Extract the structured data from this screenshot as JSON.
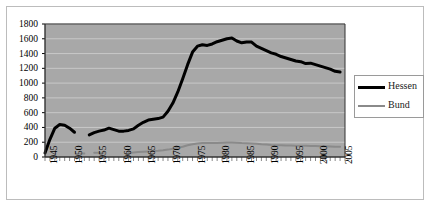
{
  "chart_data": {
    "type": "line",
    "title": "",
    "subtitle": "",
    "xlabel": "",
    "ylabel": "",
    "xlim": [
      1945,
      2006
    ],
    "ylim": [
      0,
      1800
    ],
    "ytick_step": 200,
    "yticks": [
      "0",
      "200",
      "400",
      "600",
      "800",
      "1000",
      "1200",
      "1400",
      "1600",
      "1800"
    ],
    "xticks": [
      "1945",
      "1950",
      "1955",
      "1960",
      "1965",
      "1970",
      "1975",
      "1980",
      "1985",
      "1990",
      "1995",
      "2000",
      "2005"
    ],
    "xtick_step": 5,
    "minor_xticks_every_year": true,
    "grid": "horizontal",
    "grid_color": "#c8c8c8",
    "plot_background": "#a8a8a8",
    "legend_position": "right",
    "legend": [
      "Hessen",
      "Bund"
    ],
    "series": [
      {
        "name": "Hessen",
        "color": "#000000",
        "width": 3,
        "segments": [
          {
            "x": [
              1945,
              1946,
              1947,
              1948,
              1949,
              1950,
              1951
            ],
            "y": [
              55,
              240,
              390,
              440,
              430,
              390,
              335
            ]
          },
          {
            "x": [
              1954,
              1955,
              1956,
              1957,
              1958,
              1959,
              1960,
              1961,
              1962,
              1963,
              1964,
              1965,
              1966,
              1967,
              1968,
              1969,
              1970,
              1971,
              1972,
              1973,
              1974,
              1975,
              1976,
              1977,
              1978,
              1979,
              1980,
              1981,
              1982,
              1983,
              1984,
              1985,
              1986,
              1987,
              1988,
              1989,
              1990,
              1991,
              1992,
              1993,
              1994,
              1995,
              1996,
              1997,
              1998,
              1999,
              2000,
              2001,
              2002,
              2003,
              2004,
              2005
            ],
            "y": [
              300,
              330,
              350,
              365,
              390,
              370,
              350,
              350,
              360,
              380,
              430,
              470,
              500,
              510,
              520,
              540,
              620,
              730,
              880,
              1060,
              1250,
              1420,
              1500,
              1520,
              1510,
              1530,
              1560,
              1580,
              1600,
              1610,
              1570,
              1545,
              1555,
              1555,
              1500,
              1470,
              1440,
              1410,
              1390,
              1360,
              1340,
              1320,
              1300,
              1290,
              1265,
              1270,
              1250,
              1230,
              1210,
              1190,
              1160,
              1150
            ]
          }
        ]
      },
      {
        "name": "Bund",
        "color": "#8a8a8a",
        "width": 2,
        "segments": [
          {
            "x": [
              1952,
              1953
            ],
            "y": [
              48,
              48
            ]
          },
          {
            "x": [
              1955,
              1956,
              1957
            ],
            "y": [
              58,
              58,
              58
            ]
          },
          {
            "x": [
              1962,
              1963,
              1964,
              1965,
              1966,
              1967,
              1968,
              1969,
              1970,
              1971,
              1972,
              1973,
              1974,
              1975,
              1976,
              1977,
              1978,
              1979,
              1980,
              1981,
              1982,
              1983,
              1984,
              1985,
              1986,
              1987,
              1988,
              1989,
              1990,
              1991,
              1992,
              1993,
              1994,
              1995,
              1996,
              1997,
              1998,
              1999,
              2000,
              2001,
              2002,
              2003,
              2004,
              2005
            ],
            "y": [
              55,
              62,
              68,
              72,
              76,
              80,
              84,
              90,
              100,
              112,
              125,
              140,
              158,
              172,
              182,
              188,
              190,
              190,
              190,
              192,
              195,
              196,
              192,
              188,
              186,
              184,
              180,
              172,
              168,
              163,
              160,
              158,
              155,
              155,
              153,
              152,
              152,
              150,
              148,
              146,
              144,
              142,
              140,
              140
            ]
          }
        ]
      }
    ]
  },
  "legend": {
    "items": [
      {
        "label": "Hessen"
      },
      {
        "label": "Bund"
      }
    ]
  }
}
